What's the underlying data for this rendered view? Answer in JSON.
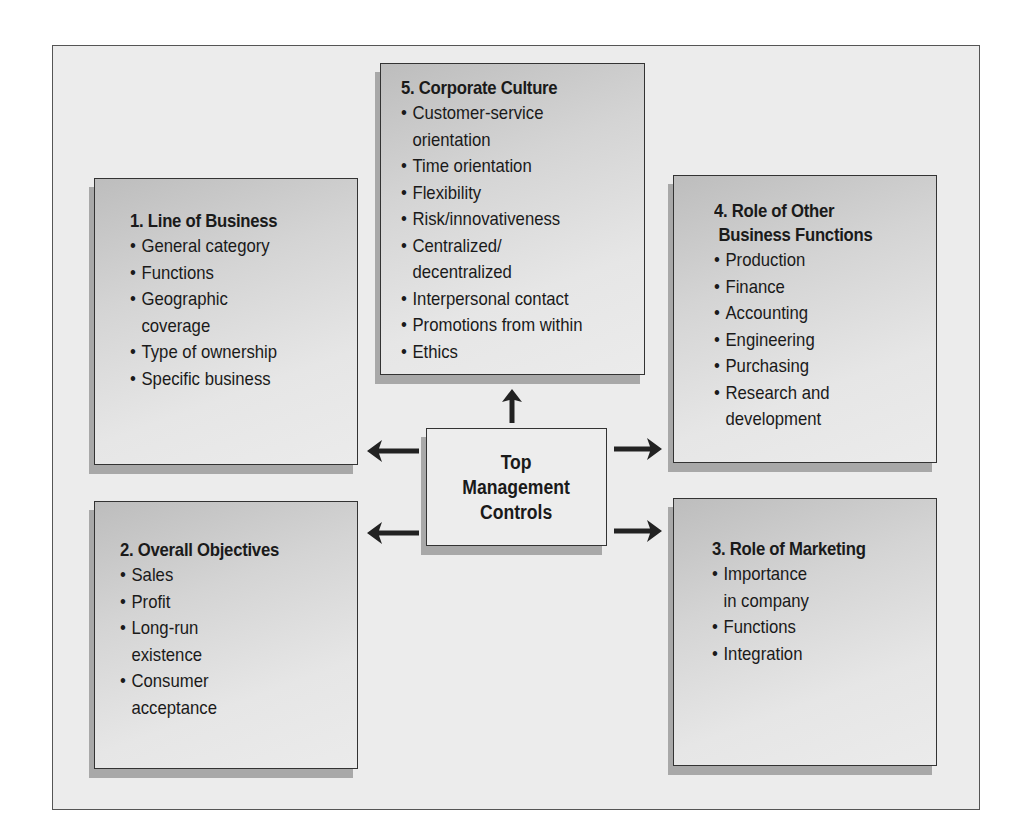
{
  "center": {
    "lines": [
      "Top",
      "Management",
      "Controls"
    ]
  },
  "boxes": {
    "line_of_business": {
      "title": "1. Line of Business",
      "items": [
        [
          "General category"
        ],
        [
          "Functions"
        ],
        [
          "Geographic",
          "coverage"
        ],
        [
          "Type of ownership"
        ],
        [
          "Specific business"
        ]
      ]
    },
    "overall_objectives": {
      "title": "2. Overall Objectives",
      "items": [
        [
          "Sales"
        ],
        [
          "Profit"
        ],
        [
          "Long-run",
          "existence"
        ],
        [
          "Consumer",
          "acceptance"
        ]
      ]
    },
    "role_of_marketing": {
      "title": "3. Role of Marketing",
      "items": [
        [
          "Importance",
          "in company"
        ],
        [
          "Functions"
        ],
        [
          "Integration"
        ]
      ]
    },
    "role_of_other_functions": {
      "title_lines": [
        "4. Role of Other",
        "Business Functions"
      ],
      "items": [
        [
          "Production"
        ],
        [
          "Finance"
        ],
        [
          "Accounting"
        ],
        [
          "Engineering"
        ],
        [
          "Purchasing"
        ],
        [
          "Research and",
          "development"
        ]
      ]
    },
    "corporate_culture": {
      "title": "5. Corporate Culture",
      "items": [
        [
          "Customer-service",
          "orientation"
        ],
        [
          "Time orientation"
        ],
        [
          "Flexibility"
        ],
        [
          "Risk/innovativeness"
        ],
        [
          "Centralized/",
          "decentralized"
        ],
        [
          "Interpersonal contact"
        ],
        [
          "Promotions from within"
        ],
        [
          "Ethics"
        ]
      ]
    }
  },
  "arrows": [
    {
      "from": "center",
      "to": "corporate_culture",
      "direction": "up"
    },
    {
      "from": "center",
      "to": "line_of_business",
      "direction": "left"
    },
    {
      "from": "center",
      "to": "overall_objectives",
      "direction": "left"
    },
    {
      "from": "center",
      "to": "role_of_other_functions",
      "direction": "right"
    },
    {
      "from": "center",
      "to": "role_of_marketing",
      "direction": "right"
    }
  ],
  "bullet": "•"
}
